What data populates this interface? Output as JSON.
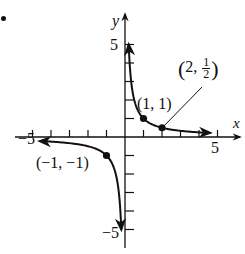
{
  "problem_marker": "•",
  "chart_data": {
    "type": "line",
    "title": "",
    "function": "y = 1/x",
    "xlabel": "x",
    "ylabel": "y",
    "xlim": [
      -5.5,
      6
    ],
    "ylim": [
      -6,
      6
    ],
    "x_tick_step": 1,
    "y_tick_step": 1,
    "x_tick_labels": [
      "-5",
      "5"
    ],
    "y_tick_labels": [
      "5",
      "-5"
    ],
    "grid": false,
    "series": [
      {
        "name": "branch-positive",
        "x": [
          0.2,
          0.25,
          0.33,
          0.5,
          1,
          2,
          3,
          4,
          4.6
        ],
        "y": [
          5,
          4,
          3,
          2,
          1,
          0.5,
          0.333,
          0.25,
          0.217
        ]
      },
      {
        "name": "branch-negative",
        "x": [
          -4.6,
          -4,
          -3,
          -2,
          -1,
          -0.5,
          -0.33,
          -0.25,
          -0.2
        ],
        "y": [
          -0.217,
          -0.25,
          -0.333,
          -0.5,
          -1,
          -2,
          -3,
          -4,
          -5
        ]
      }
    ],
    "points": [
      {
        "x": 1,
        "y": 1,
        "label": "(1, 1)"
      },
      {
        "x": 2,
        "y": 0.5,
        "label_prefix": "(2, ",
        "label_num": "1",
        "label_den": "2",
        "label_suffix": ")"
      },
      {
        "x": -1,
        "y": -1,
        "label": "(−1, −1)"
      }
    ],
    "annotations": [
      {
        "text": "(2, 1/2)",
        "leader_line": true
      }
    ]
  },
  "labels": {
    "x_axis": "x",
    "y_axis": "y",
    "x_pos5": "5",
    "x_neg5": "−5",
    "y_pos5": "5",
    "y_neg5": "−5",
    "pt1": "(1, 1)",
    "pt3": "(−1, −1)",
    "pt2_open": "(",
    "pt2_mid": "2,",
    "pt2_num": "1",
    "pt2_den": "2",
    "pt2_close": ")"
  }
}
